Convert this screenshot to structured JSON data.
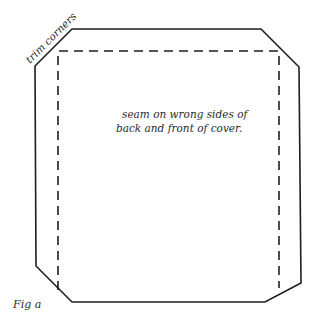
{
  "figure": {
    "caption": "Fig a",
    "corner_label": "trim corners",
    "seam_note": {
      "line1": "seam on wrong sides of",
      "line2": "back and front of cover."
    }
  },
  "colors": {
    "line": "#1e1e1e",
    "text": "#2a2a2a",
    "background": "#ffffff"
  }
}
